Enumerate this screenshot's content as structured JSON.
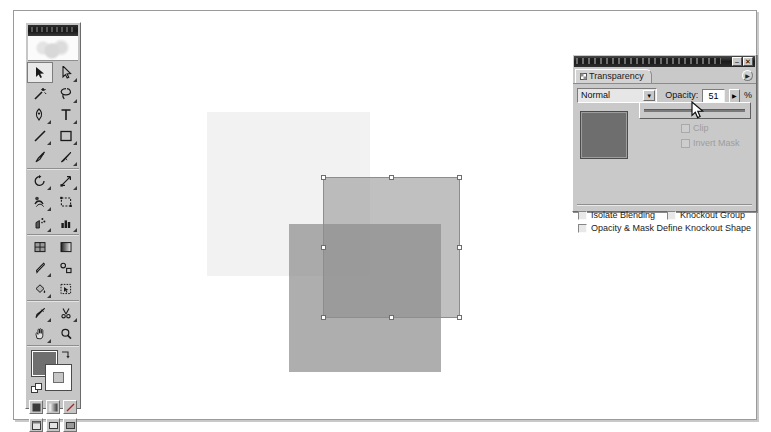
{
  "application": {
    "name": "Adobe Illustrator",
    "toolbox": {
      "title_bar_text": "",
      "tools": [
        {
          "name": "selection-tool",
          "label": "Selection",
          "selected": true,
          "has_flyout": false
        },
        {
          "name": "direct-selection-tool",
          "label": "Direct Selection",
          "selected": false,
          "has_flyout": true
        },
        {
          "name": "magic-wand-tool",
          "label": "Magic Wand",
          "selected": false,
          "has_flyout": false
        },
        {
          "name": "lasso-tool",
          "label": "Lasso",
          "selected": false,
          "has_flyout": true
        },
        {
          "name": "pen-tool",
          "label": "Pen",
          "selected": false,
          "has_flyout": true
        },
        {
          "name": "type-tool",
          "label": "Type",
          "selected": false,
          "has_flyout": true
        },
        {
          "name": "line-segment-tool",
          "label": "Line Segment",
          "selected": false,
          "has_flyout": true
        },
        {
          "name": "rectangle-tool",
          "label": "Rectangle",
          "selected": false,
          "has_flyout": true
        },
        {
          "name": "paintbrush-tool",
          "label": "Paintbrush",
          "selected": false,
          "has_flyout": false
        },
        {
          "name": "pencil-tool",
          "label": "Pencil",
          "selected": false,
          "has_flyout": true
        },
        {
          "name": "rotate-tool",
          "label": "Rotate",
          "selected": false,
          "has_flyout": true
        },
        {
          "name": "scale-tool",
          "label": "Scale",
          "selected": false,
          "has_flyout": true
        },
        {
          "name": "warp-tool",
          "label": "Warp",
          "selected": false,
          "has_flyout": true
        },
        {
          "name": "free-transform-tool",
          "label": "Free Transform",
          "selected": false,
          "has_flyout": false
        },
        {
          "name": "symbol-sprayer-tool",
          "label": "Symbol Sprayer",
          "selected": false,
          "has_flyout": true
        },
        {
          "name": "column-graph-tool",
          "label": "Column Graph",
          "selected": false,
          "has_flyout": true
        },
        {
          "name": "mesh-tool",
          "label": "Mesh",
          "selected": false,
          "has_flyout": false
        },
        {
          "name": "gradient-tool",
          "label": "Gradient",
          "selected": false,
          "has_flyout": false
        },
        {
          "name": "eyedropper-tool",
          "label": "Eyedropper",
          "selected": false,
          "has_flyout": true
        },
        {
          "name": "blend-tool",
          "label": "Blend",
          "selected": false,
          "has_flyout": false
        },
        {
          "name": "live-paint-bucket-tool",
          "label": "Live Paint Bucket",
          "selected": false,
          "has_flyout": true
        },
        {
          "name": "live-paint-selection-tool",
          "label": "Live Paint Selection",
          "selected": false,
          "has_flyout": false
        },
        {
          "name": "slice-tool",
          "label": "Slice",
          "selected": false,
          "has_flyout": true
        },
        {
          "name": "scissors-tool",
          "label": "Scissors",
          "selected": false,
          "has_flyout": true
        },
        {
          "name": "hand-tool",
          "label": "Hand",
          "selected": false,
          "has_flyout": true
        },
        {
          "name": "zoom-tool",
          "label": "Zoom",
          "selected": false,
          "has_flyout": false
        }
      ],
      "fill_color": "#6f6f6f",
      "stroke_color": "#ffffff",
      "color_mode_buttons": [
        {
          "name": "color-button",
          "label": "Color"
        },
        {
          "name": "gradient-button",
          "label": "Gradient"
        },
        {
          "name": "none-button",
          "label": "None"
        }
      ],
      "screen_mode_buttons": [
        {
          "name": "standard-screen-mode-button",
          "label": "Standard Screen Mode"
        },
        {
          "name": "full-screen-menubar-button",
          "label": "Full Screen Mode With Menu Bar"
        },
        {
          "name": "full-screen-button",
          "label": "Full Screen Mode"
        }
      ]
    },
    "palette": {
      "title_bar_text": "",
      "window_buttons": [
        {
          "name": "minimize-button",
          "glyph": "–"
        },
        {
          "name": "close-button",
          "glyph": "✕"
        }
      ],
      "tab_label": "Transparency",
      "menu_button_glyph": "▶",
      "blend_mode": {
        "label": "Blending Mode",
        "value": "Normal",
        "arrow_glyph": "▼",
        "options": [
          "Normal",
          "Multiply",
          "Screen",
          "Overlay",
          "Soft Light",
          "Hard Light",
          "Color Dodge",
          "Color Burn",
          "Darken",
          "Lighten",
          "Difference",
          "Exclusion",
          "Hue",
          "Saturation",
          "Color",
          "Luminosity"
        ]
      },
      "opacity": {
        "label": "Opacity:",
        "value": "51",
        "unit": "%",
        "arrow_glyph": "▶",
        "slider_percent": 51
      },
      "thumbnail_color": "#6e6e6e",
      "dimmed_options": [
        {
          "name": "clip-checkbox",
          "label": "Clip",
          "checked": false,
          "enabled": false
        },
        {
          "name": "invert-mask-checkbox",
          "label": "Invert Mask",
          "checked": false,
          "enabled": false
        }
      ],
      "bottom_options": [
        {
          "name": "isolate-blending-checkbox",
          "label": "Isolate Blending",
          "checked": false
        },
        {
          "name": "knockout-group-checkbox",
          "label": "Knockout Group",
          "checked": false
        },
        {
          "name": "opacity-mask-knockout-checkbox",
          "label": "Opacity & Mask Define Knockout Shape",
          "checked": false
        }
      ]
    },
    "artboard": {
      "shapes": [
        {
          "name": "square-back-light",
          "fill": "#f2f2f2",
          "left": 206,
          "top": 111,
          "width": 163,
          "height": 164,
          "selected": false
        },
        {
          "name": "square-selected-mid",
          "fill": "#9a9a9a",
          "opacity": 0.62,
          "left": 322,
          "top": 176,
          "width": 137,
          "height": 141,
          "selected": true
        },
        {
          "name": "square-front-dark",
          "fill": "#8c8c8c",
          "opacity": 0.7,
          "left": 288,
          "top": 223,
          "width": 152,
          "height": 148,
          "selected": false
        }
      ],
      "selection": {
        "name": "selection-bounds",
        "left": 322,
        "top": 176,
        "width": 137,
        "height": 141,
        "handle_color": "#ffffff",
        "handle_border": "#6d6d6d"
      }
    },
    "cursor": {
      "name": "mouse-pointer",
      "x": 691,
      "y": 101
    }
  }
}
